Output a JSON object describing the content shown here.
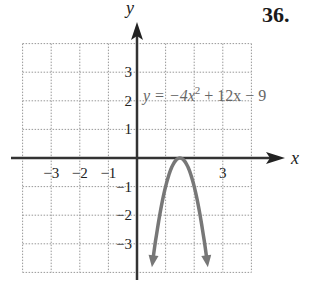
{
  "problem_number": "36.",
  "chart_data": {
    "type": "line",
    "title": "",
    "xlabel": "x",
    "ylabel": "y",
    "xlim": [
      -4,
      4
    ],
    "ylim": [
      -4,
      4
    ],
    "grid": true,
    "x_ticks": [
      "-3",
      "-2",
      "-1",
      "3"
    ],
    "y_ticks": [
      "3",
      "2",
      "1",
      "-1",
      "-2",
      "-3"
    ],
    "series": [
      {
        "name": "y = -4x^2 + 12x - 9",
        "equation": "y = −4x² + 12x − 9",
        "vertex": [
          1.5,
          0
        ],
        "x": [
          0.5,
          0.75,
          1.0,
          1.25,
          1.5,
          1.75,
          2.0,
          2.25,
          2.5
        ],
        "values": [
          -4,
          -2.25,
          -1,
          -0.25,
          0,
          -0.25,
          -1,
          -2.25,
          -4
        ],
        "color": "#777777"
      }
    ],
    "annotations": [
      {
        "text_parts": [
          "y = −4x",
          "2",
          " + 12x − 9"
        ],
        "position": [
          0.3,
          2.2
        ]
      }
    ]
  }
}
